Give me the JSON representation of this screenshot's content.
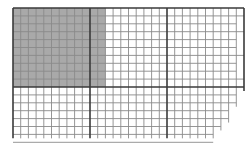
{
  "diagram": {
    "type": "grid-area-model",
    "origin": {
      "x": 13,
      "y": 8
    },
    "cell_width": 7.7,
    "cell_height": 7.9,
    "columns": 30,
    "rows": 17,
    "major_every": 10,
    "shaded_region": {
      "columns": 12,
      "rows": 10,
      "start_column": 0,
      "start_row": 0
    },
    "ragged_right_ends": [
      30,
      30,
      29,
      30,
      29,
      29,
      30,
      29,
      29,
      30,
      30,
      29,
      29,
      28,
      28,
      27,
      26
    ],
    "colors": {
      "background": "#ffffff",
      "shade": "#a9a9a9",
      "minor_line": "#8a8a8a",
      "major_line": "#3a3a3a"
    }
  }
}
